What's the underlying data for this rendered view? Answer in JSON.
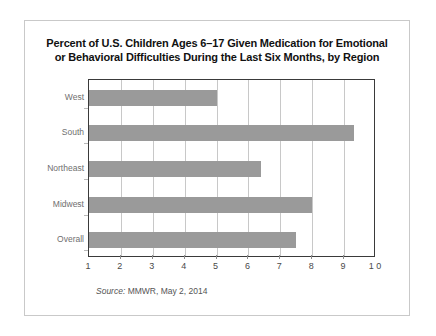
{
  "chart_data": {
    "type": "bar",
    "orientation": "horizontal",
    "title": "Percent of U.S. Children Ages 6–17 Given Medication for Emotional or Behavioral Difficulties During the Last Six Months, by Region",
    "title_lines": [
      "Percent of U.S. Children Ages 6–17 Given Medication for Emotional",
      "or Behavioral Difficulties During the Last Six Months, by Region"
    ],
    "categories": [
      "West",
      "South",
      "Northeast",
      "Midwest",
      "Overall"
    ],
    "values": [
      5.0,
      9.3,
      6.4,
      8.0,
      7.5
    ],
    "xlabel": "",
    "ylabel": "",
    "xlim": [
      1,
      10
    ],
    "ylim": null,
    "x_ticks": [
      "1",
      "2",
      "3",
      "4",
      "5",
      "6",
      "7",
      "8",
      "9",
      "1 0"
    ],
    "x_tick_values": [
      1,
      2,
      3,
      4,
      5,
      6,
      7,
      8,
      9,
      10
    ],
    "grid": "vertical",
    "legend": null,
    "bar_color": "#9a9a9a",
    "gridline_color": "#c8c8c8",
    "axis_color": "#3a3a3a",
    "frame_color": "#c9c9c9",
    "background": "#ffffff"
  },
  "source": {
    "prefix": "Source:",
    "text": " MMWR, May 2, 2014"
  }
}
